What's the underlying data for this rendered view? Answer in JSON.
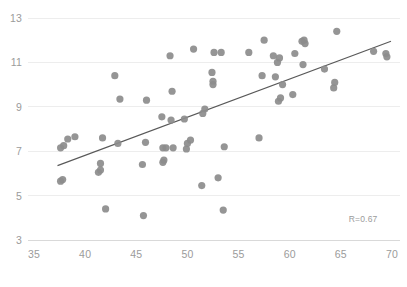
{
  "chart_data": {
    "type": "scatter",
    "title": "",
    "subtitle": "",
    "xlabel": "",
    "ylabel": "",
    "xlim": [
      35,
      70
    ],
    "ylim": [
      3,
      13
    ],
    "xticks": [
      35,
      40,
      45,
      50,
      55,
      60,
      65,
      70
    ],
    "yticks": [
      3,
      5,
      7,
      9,
      11,
      13
    ],
    "grid": "horizontal",
    "legend": "none",
    "annotations": [
      {
        "text": "R=0.67",
        "x": 68.5,
        "y": 3.9
      }
    ],
    "series": [
      {
        "name": "observations",
        "marker": "circle",
        "color": "#8c8c8c",
        "points": [
          [
            37.6,
            5.65
          ],
          [
            37.8,
            5.72
          ],
          [
            37.6,
            7.15
          ],
          [
            37.9,
            7.25
          ],
          [
            38.3,
            7.55
          ],
          [
            39.0,
            7.65
          ],
          [
            41.3,
            6.05
          ],
          [
            41.5,
            6.15
          ],
          [
            41.5,
            6.45
          ],
          [
            41.7,
            7.6
          ],
          [
            42.0,
            4.4
          ],
          [
            42.9,
            10.4
          ],
          [
            43.2,
            7.35
          ],
          [
            43.4,
            9.35
          ],
          [
            45.7,
            4.1
          ],
          [
            45.6,
            6.4
          ],
          [
            45.9,
            7.4
          ],
          [
            46.0,
            9.3
          ],
          [
            47.5,
            8.55
          ],
          [
            47.6,
            7.15
          ],
          [
            47.6,
            6.5
          ],
          [
            47.7,
            6.6
          ],
          [
            47.9,
            7.15
          ],
          [
            48.3,
            11.3
          ],
          [
            48.4,
            8.4
          ],
          [
            48.5,
            9.7
          ],
          [
            48.6,
            7.15
          ],
          [
            49.7,
            8.45
          ],
          [
            49.9,
            7.1
          ],
          [
            50.0,
            7.35
          ],
          [
            50.3,
            7.5
          ],
          [
            50.6,
            11.6
          ],
          [
            51.4,
            5.45
          ],
          [
            51.5,
            8.7
          ],
          [
            51.7,
            8.9
          ],
          [
            52.5,
            10.0
          ],
          [
            52.5,
            10.15
          ],
          [
            52.4,
            10.55
          ],
          [
            52.6,
            11.45
          ],
          [
            53.0,
            5.8
          ],
          [
            53.3,
            11.45
          ],
          [
            53.5,
            4.35
          ],
          [
            53.6,
            7.2
          ],
          [
            56.0,
            11.45
          ],
          [
            57.0,
            7.6
          ],
          [
            57.3,
            10.4
          ],
          [
            57.5,
            12.0
          ],
          [
            58.4,
            11.3
          ],
          [
            58.6,
            10.35
          ],
          [
            58.8,
            11.0
          ],
          [
            58.9,
            9.25
          ],
          [
            59.1,
            9.4
          ],
          [
            59.3,
            10.0
          ],
          [
            59.0,
            11.2
          ],
          [
            60.3,
            9.55
          ],
          [
            60.5,
            11.4
          ],
          [
            61.2,
            11.95
          ],
          [
            61.4,
            12.0
          ],
          [
            61.5,
            11.85
          ],
          [
            61.3,
            10.9
          ],
          [
            63.4,
            10.7
          ],
          [
            64.3,
            9.85
          ],
          [
            64.4,
            10.1
          ],
          [
            64.6,
            12.4
          ],
          [
            68.2,
            11.5
          ],
          [
            69.4,
            11.4
          ],
          [
            69.5,
            11.25
          ]
        ]
      }
    ],
    "trendline": {
      "name": "linear-fit",
      "color": "#595959",
      "x_start": 37.3,
      "y_start": 6.35,
      "x_end": 69.9,
      "y_end": 11.95
    }
  },
  "axes": {
    "x_tick_labels": [
      "35",
      "40",
      "45",
      "50",
      "55",
      "60",
      "65",
      "70"
    ],
    "y_tick_labels": [
      "3",
      "5",
      "7",
      "9",
      "11",
      "13"
    ]
  },
  "colors": {
    "marker": "#8c8c8c",
    "trendline": "#595959",
    "gridline": "#ededed",
    "axis": "#d9d9d9",
    "tick_text": "#9b9b9b",
    "background": "#ffffff"
  }
}
